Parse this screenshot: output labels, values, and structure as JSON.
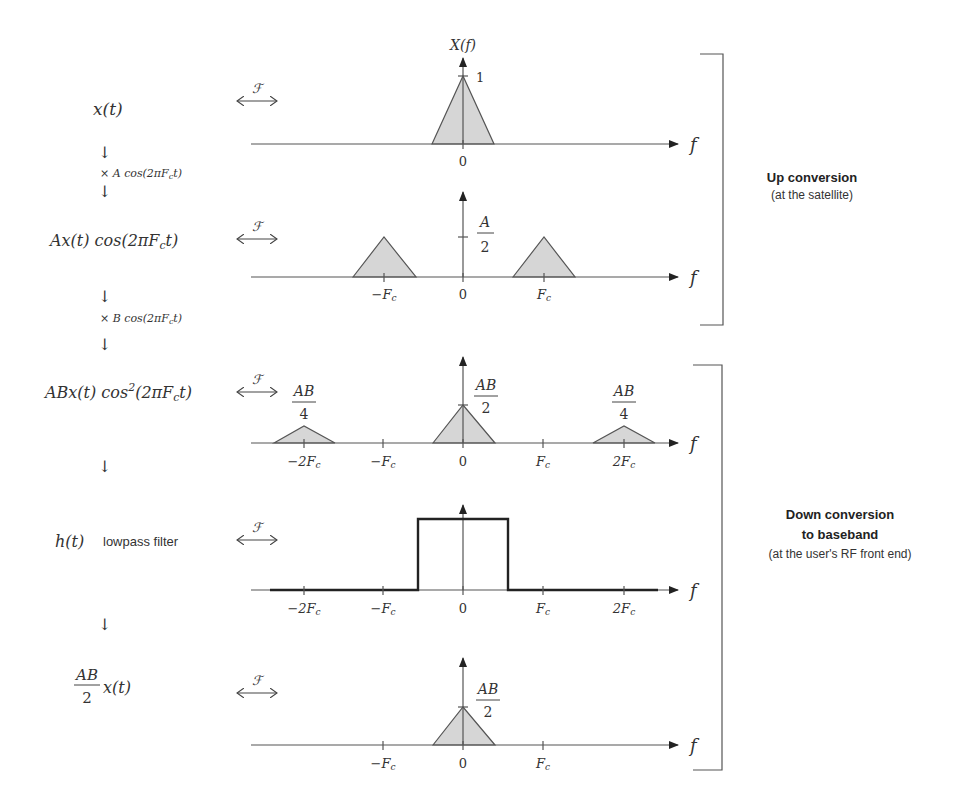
{
  "fourier_symbol": "ℱ",
  "axis_label": "f",
  "left_column": {
    "step1": {
      "expr": "x(t)"
    },
    "arrow": "↓",
    "mult_A": {
      "pre": "× A cos(2πF",
      "sub": "c",
      "post": "t)"
    },
    "step2": {
      "pre": "Ax(t) cos(2πF",
      "sub": "c",
      "post": "t)"
    },
    "mult_B": {
      "pre": "× B cos(2πF",
      "sub": "c",
      "post": "t)"
    },
    "step3": {
      "pre": "ABx(t) cos",
      "sup": "2",
      "mid": "(2πF",
      "sub": "c",
      "post": "t)"
    },
    "step4": {
      "expr": "h(t)",
      "text": "lowpass filter"
    },
    "step5": {
      "num": "AB",
      "den": "2",
      "post": "x(t)"
    }
  },
  "plots": [
    {
      "title": "X(f)",
      "peak_label": "1",
      "ticks": [
        {
          "main": "0",
          "sub": ""
        }
      ]
    },
    {
      "peak_label": {
        "num": "A",
        "den": "2"
      },
      "ticks": [
        {
          "main": "−F",
          "sub": "c"
        },
        {
          "main": "0",
          "sub": ""
        },
        {
          "main": "F",
          "sub": "c"
        }
      ]
    },
    {
      "center_label": {
        "num": "AB",
        "den": "2"
      },
      "side_label": {
        "num": "AB",
        "den": "4"
      },
      "ticks": [
        {
          "main": "−2F",
          "sub": "c"
        },
        {
          "main": "−F",
          "sub": "c"
        },
        {
          "main": "0",
          "sub": ""
        },
        {
          "main": "F",
          "sub": "c"
        },
        {
          "main": "2F",
          "sub": "c"
        }
      ]
    },
    {
      "ticks": [
        {
          "main": "−2F",
          "sub": "c"
        },
        {
          "main": "−F",
          "sub": "c"
        },
        {
          "main": "0",
          "sub": ""
        },
        {
          "main": "F",
          "sub": "c"
        },
        {
          "main": "2F",
          "sub": "c"
        }
      ]
    },
    {
      "peak_label": {
        "num": "AB",
        "den": "2"
      },
      "ticks": [
        {
          "main": "−F",
          "sub": "c"
        },
        {
          "main": "0",
          "sub": ""
        },
        {
          "main": "F",
          "sub": "c"
        }
      ]
    }
  ],
  "annotations": {
    "up": {
      "title": "Up conversion",
      "subtitle": "(at the satellite)"
    },
    "down": {
      "title_line1": "Down conversion",
      "title_line2": "to baseband",
      "subtitle": "(at the user's RF front end)"
    }
  },
  "colors": {
    "fill": "#d6d6d6",
    "stroke": "#555555",
    "text": "#333333"
  }
}
